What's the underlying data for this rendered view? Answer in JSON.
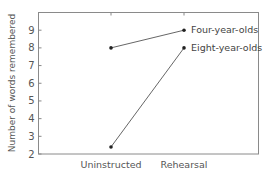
{
  "chart_data": {
    "type": "line",
    "title": "",
    "xlabel": "",
    "ylabel": "Number of words remembered",
    "categories": [
      "Uninstructed",
      "Rehearsal"
    ],
    "ylim": [
      2,
      10
    ],
    "yticks": [
      2,
      3,
      4,
      5,
      6,
      7,
      8,
      9
    ],
    "grid": false,
    "legend": "direct labels at right end of lines",
    "series": [
      {
        "name": "Four-year-olds",
        "values": [
          8,
          9
        ]
      },
      {
        "name": "Eight-year-olds",
        "values": [
          2.4,
          8
        ]
      }
    ],
    "colors": {
      "line": "#555555",
      "marker": "#222222",
      "axis": "#888888",
      "text": "#555555"
    }
  }
}
